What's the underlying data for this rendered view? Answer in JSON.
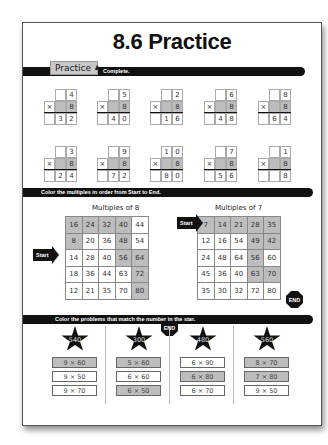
{
  "title": "8.6 Practice",
  "practice_tab": {
    "label": "Practice",
    "icon": "person-icon"
  },
  "section1": {
    "instruction": "Complete."
  },
  "multiplication_problems": [
    {
      "top": [
        "",
        "4"
      ],
      "multiplier": "8",
      "answer": [
        "3",
        "2"
      ]
    },
    {
      "top": [
        "",
        "5"
      ],
      "multiplier": "8",
      "answer": [
        "4",
        "0"
      ]
    },
    {
      "top": [
        "",
        "2"
      ],
      "multiplier": "8",
      "answer": [
        "1",
        "6"
      ]
    },
    {
      "top": [
        "",
        "6"
      ],
      "multiplier": "8",
      "answer": [
        "4",
        "8"
      ]
    },
    {
      "top": [
        "",
        "8"
      ],
      "multiplier": "8",
      "answer": [
        "6",
        "4"
      ]
    },
    {
      "top": [
        "",
        "3"
      ],
      "multiplier": "8",
      "answer": [
        "2",
        "4"
      ]
    },
    {
      "top": [
        "",
        "9"
      ],
      "multiplier": "8",
      "answer": [
        "7",
        "2"
      ]
    },
    {
      "top": [
        "1",
        "0"
      ],
      "multiplier": "8",
      "answer": [
        "8",
        "0"
      ]
    },
    {
      "top": [
        "",
        "7"
      ],
      "multiplier": "8",
      "answer": [
        "5",
        "6"
      ]
    },
    {
      "top": [
        "",
        "1"
      ],
      "multiplier": "8",
      "answer": [
        "",
        "8"
      ]
    }
  ],
  "times_sign": "×",
  "section2": {
    "instruction": "Color the multiples in order from Start to End."
  },
  "start_label": "Start",
  "end_label": "END",
  "grids": [
    {
      "title": "Multiples of 8",
      "rows": [
        [
          "16",
          "24",
          "32",
          "40",
          "44"
        ],
        [
          "8",
          "20",
          "36",
          "48",
          "54"
        ],
        [
          "14",
          "28",
          "40",
          "56",
          "64"
        ],
        [
          "18",
          "36",
          "44",
          "63",
          "72"
        ],
        [
          "12",
          "21",
          "35",
          "70",
          "80"
        ]
      ],
      "shaded": [
        [
          1,
          1,
          1,
          1,
          0
        ],
        [
          1,
          0,
          0,
          1,
          0
        ],
        [
          0,
          0,
          0,
          1,
          1
        ],
        [
          0,
          0,
          0,
          0,
          1
        ],
        [
          0,
          0,
          0,
          0,
          1
        ]
      ]
    },
    {
      "title": "Multiples of 7",
      "rows": [
        [
          "7",
          "14",
          "21",
          "28",
          "35"
        ],
        [
          "12",
          "16",
          "54",
          "49",
          "42"
        ],
        [
          "24",
          "48",
          "64",
          "56",
          "60"
        ],
        [
          "45",
          "36",
          "40",
          "63",
          "70"
        ],
        [
          "35",
          "30",
          "32",
          "72",
          "80"
        ]
      ],
      "shaded": [
        [
          1,
          1,
          1,
          1,
          1
        ],
        [
          0,
          0,
          0,
          1,
          1
        ],
        [
          0,
          0,
          0,
          1,
          0
        ],
        [
          0,
          0,
          0,
          1,
          1
        ],
        [
          0,
          0,
          0,
          0,
          0
        ]
      ]
    }
  ],
  "section3": {
    "instruction": "Color the problems that match the number in the star."
  },
  "star_columns": [
    {
      "star": "540",
      "problems": [
        {
          "text": "9 × 60",
          "shaded": true
        },
        {
          "text": "9 × 50",
          "shaded": false
        },
        {
          "text": "9 × 70",
          "shaded": false
        }
      ]
    },
    {
      "star": "300",
      "problems": [
        {
          "text": "5 × 60",
          "shaded": true
        },
        {
          "text": "6 × 60",
          "shaded": false
        },
        {
          "text": "6 × 50",
          "shaded": true
        }
      ]
    },
    {
      "star": "480",
      "problems": [
        {
          "text": "6 × 90",
          "shaded": false
        },
        {
          "text": "6 × 80",
          "shaded": true
        },
        {
          "text": "6 × 70",
          "shaded": false
        }
      ]
    },
    {
      "star": "560",
      "problems": [
        {
          "text": "8 × 70",
          "shaded": true
        },
        {
          "text": "7 × 80",
          "shaded": true
        },
        {
          "text": "9 × 50",
          "shaded": false
        }
      ]
    }
  ],
  "colors": {
    "shade": "#bdbdbd",
    "bar": "#111111"
  }
}
